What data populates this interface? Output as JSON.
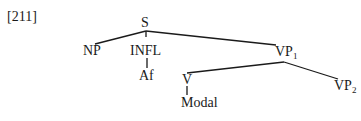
{
  "example_number": "[211]",
  "tree": {
    "root": {
      "label": "S"
    },
    "nodes": {
      "np": {
        "label": "NP"
      },
      "infl": {
        "label": "INFL"
      },
      "af": {
        "label": "Af"
      },
      "vp1": {
        "label": "VP",
        "subscript": "1"
      },
      "v": {
        "label": "V"
      },
      "modal": {
        "label": "Modal"
      },
      "vp2": {
        "label": "VP",
        "subscript": "2"
      }
    },
    "edges": [
      {
        "from": "S",
        "to": "NP"
      },
      {
        "from": "S",
        "to": "INFL"
      },
      {
        "from": "S",
        "to": "VP1"
      },
      {
        "from": "INFL",
        "to": "Af"
      },
      {
        "from": "VP1",
        "to": "V"
      },
      {
        "from": "VP1",
        "to": "VP2"
      },
      {
        "from": "V",
        "to": "Modal"
      }
    ]
  }
}
